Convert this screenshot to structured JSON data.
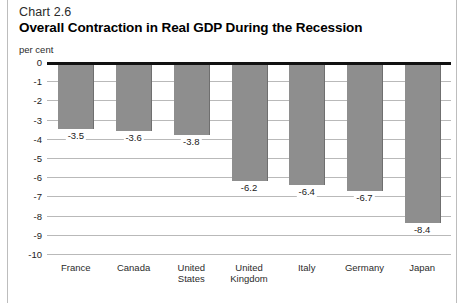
{
  "figure": {
    "chart_number": "Chart 2.6",
    "title": "Overall Contraction in Real GDP During the Recession",
    "unit_label": "per cent"
  },
  "chart_data": {
    "type": "bar",
    "title": "Overall Contraction in Real GDP During the Recession",
    "subtitle": "Chart 2.6",
    "xlabel": "",
    "ylabel": "per cent",
    "ylim": [
      -10,
      0
    ],
    "grid": true,
    "legend": "none",
    "categories": [
      "France",
      "Canada",
      "United States",
      "United Kingdom",
      "Italy",
      "Germany",
      "Japan"
    ],
    "values": [
      -3.5,
      -3.6,
      -3.8,
      -6.2,
      -6.4,
      -6.7,
      -8.4
    ],
    "data_labels": [
      "-3.5",
      "-3.6",
      "-3.8",
      "-6.2",
      "-6.4",
      "-6.7",
      "-8.4"
    ],
    "yticks": [
      "0",
      "-1",
      "-2",
      "-3",
      "-4",
      "-5",
      "-6",
      "-7",
      "-8",
      "-9",
      "-10"
    ],
    "ytick_values": [
      0,
      -1,
      -2,
      -3,
      -4,
      -5,
      -6,
      -7,
      -8,
      -9,
      -10
    ],
    "bar_color": "#8e8e8e",
    "zero_axis_color": "#111111",
    "gridline_color": "#b9b9b9"
  }
}
